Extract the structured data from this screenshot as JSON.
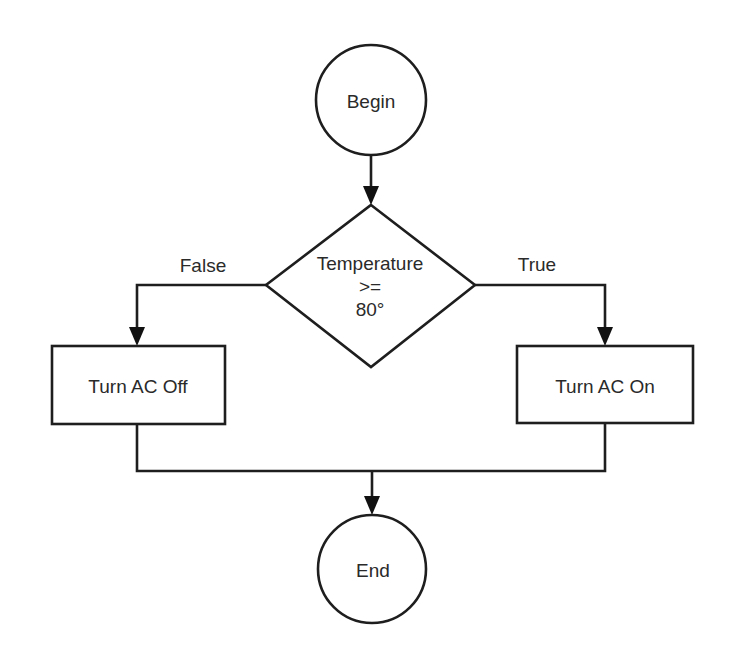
{
  "diagram": {
    "type": "flowchart",
    "nodes": {
      "begin": {
        "shape": "circle",
        "label": "Begin"
      },
      "decision": {
        "shape": "diamond",
        "label_lines": [
          "Temperature",
          ">=",
          "80°"
        ]
      },
      "ac_off": {
        "shape": "rectangle",
        "label": "Turn AC Off"
      },
      "ac_on": {
        "shape": "rectangle",
        "label": "Turn AC On"
      },
      "end": {
        "shape": "circle",
        "label": "End"
      }
    },
    "edges": {
      "false_label": "False",
      "true_label": "True"
    },
    "connections": [
      {
        "from": "Begin",
        "to": "Temperature >= 80°"
      },
      {
        "from": "Temperature >= 80°",
        "to": "Turn AC Off",
        "label": "False"
      },
      {
        "from": "Temperature >= 80°",
        "to": "Turn AC On",
        "label": "True"
      },
      {
        "from": "Turn AC Off",
        "to": "End"
      },
      {
        "from": "Turn AC On",
        "to": "End"
      }
    ],
    "colors": {
      "stroke": "#1e1e1e",
      "text": "#2a2a2a",
      "background": "#ffffff"
    }
  }
}
